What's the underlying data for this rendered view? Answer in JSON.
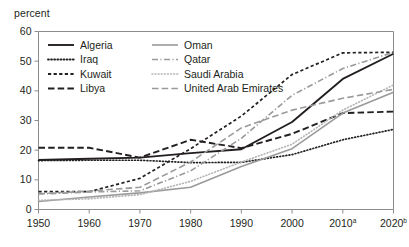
{
  "chart_data": {
    "type": "line",
    "title": "",
    "subtitle": "",
    "xlabel": "",
    "ylabel": "percent",
    "unit_label": "percent",
    "xlim": [
      1950,
      2020
    ],
    "ylim": [
      0,
      60
    ],
    "grid": false,
    "legend_position": "top-left-inside",
    "x": [
      1950,
      1960,
      1970,
      1980,
      1990,
      2000,
      2010,
      2020
    ],
    "xtick_labels": [
      "1950",
      "1960",
      "1970",
      "1980",
      "1990",
      "2000",
      "2010",
      "2020"
    ],
    "xtick_superscripts": [
      "",
      "",
      "",
      "",
      "",
      "",
      "a",
      "b"
    ],
    "ytick_labels": [
      "0",
      "10",
      "20",
      "30",
      "40",
      "50",
      "60"
    ],
    "ytick_values": [
      0,
      10,
      20,
      30,
      40,
      50,
      60
    ],
    "series": [
      {
        "name": "Algeria",
        "style": "solid",
        "color": "#231f20",
        "width": 1.9,
        "values": [
          16.7,
          17.1,
          17.5,
          19.0,
          20.3,
          29.5,
          44.0,
          52.5
        ]
      },
      {
        "name": "Iraq",
        "style": "dotted",
        "color": "#231f20",
        "width": 1.7,
        "values": [
          16.5,
          16.6,
          16.6,
          15.8,
          15.9,
          18.5,
          23.5,
          27.0
        ]
      },
      {
        "name": "Kuwait",
        "style": "dashed-short",
        "color": "#231f20",
        "width": 1.7,
        "values": [
          6.0,
          6.0,
          10.5,
          20.5,
          31.5,
          45.5,
          52.8,
          53.0
        ]
      },
      {
        "name": "Libya",
        "style": "dashed-long",
        "color": "#231f20",
        "width": 1.9,
        "values": [
          20.8,
          20.8,
          17.5,
          23.5,
          20.7,
          25.5,
          32.5,
          33.0
        ]
      },
      {
        "name": "Oman",
        "style": "solid",
        "color": "#9a9a9a",
        "width": 1.6,
        "values": [
          2.7,
          4.2,
          5.6,
          7.5,
          14.5,
          20.5,
          32.5,
          39.5
        ]
      },
      {
        "name": "Qatar",
        "style": "dash-dot",
        "color": "#9a9a9a",
        "width": 1.6,
        "values": [
          5.2,
          5.9,
          6.3,
          13.0,
          24.0,
          38.5,
          47.5,
          53.0
        ]
      },
      {
        "name": "Saudi Arabia",
        "style": "dotted",
        "color": "#b5b5b5",
        "width": 1.6,
        "values": [
          3.1,
          3.6,
          5.0,
          9.5,
          16.0,
          22.0,
          33.5,
          42.0
        ]
      },
      {
        "name": "United Arab Emirates",
        "style": "dashed-long",
        "color": "#9a9a9a",
        "width": 1.6,
        "values": [
          5.3,
          6.2,
          7.5,
          16.0,
          27.5,
          33.5,
          37.5,
          40.5
        ]
      }
    ],
    "legend": [
      {
        "label": "Algeria",
        "style": "solid",
        "color": "#231f20",
        "col": 0,
        "row": 0
      },
      {
        "label": "Iraq",
        "style": "dotted",
        "color": "#231f20",
        "col": 0,
        "row": 1
      },
      {
        "label": "Kuwait",
        "style": "dashed-short",
        "color": "#231f20",
        "col": 0,
        "row": 2
      },
      {
        "label": "Libya",
        "style": "dashed-long",
        "color": "#231f20",
        "col": 0,
        "row": 3
      },
      {
        "label": "Oman",
        "style": "solid",
        "color": "#9a9a9a",
        "col": 1,
        "row": 0
      },
      {
        "label": "Qatar",
        "style": "dash-dot",
        "color": "#9a9a9a",
        "col": 1,
        "row": 1
      },
      {
        "label": "Saudi Arabia",
        "style": "dotted",
        "color": "#b5b5b5",
        "col": 1,
        "row": 2
      },
      {
        "label": "United Arab Emirates",
        "style": "dashed-long",
        "color": "#9a9a9a",
        "col": 1,
        "row": 3
      }
    ]
  },
  "axis": {
    "unit_label": "percent"
  },
  "footnote": {
    "text": ""
  }
}
